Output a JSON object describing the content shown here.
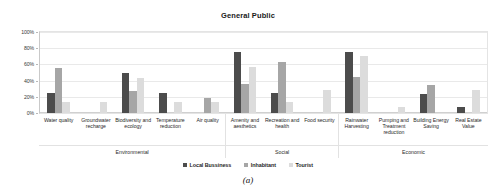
{
  "figure": {
    "caption": "(a)"
  },
  "chart_data": {
    "type": "bar",
    "title": "General Public",
    "xlabel": "",
    "ylabel": "",
    "ylim": [
      0,
      100
    ],
    "grid": true,
    "legend_position": "bottom",
    "ytick_labels": [
      "100%",
      "80%",
      "60%",
      "40%",
      "20%",
      "0%"
    ],
    "ytick_values": [
      100,
      80,
      60,
      40,
      20,
      0
    ],
    "categories": [
      "Water quality",
      "Groundwater recharge",
      "Biodiversity and ecology",
      "Temperature reduction",
      "Air quality",
      "Amenity and aesthetics",
      "Recreation and health",
      "Food security",
      "Rainwater Harvesting",
      "Pumping and Treatment reduction",
      "Building Energy Saving",
      "Real Estate Value"
    ],
    "groups": [
      {
        "name": "Environmental",
        "span": 5
      },
      {
        "name": "Social",
        "span": 3
      },
      {
        "name": "Economic",
        "span": 4
      }
    ],
    "series": [
      {
        "name": "Local Bussiness",
        "color": "#4c4c4c",
        "values": [
          25,
          0,
          50,
          25,
          0,
          75,
          25,
          0,
          75,
          0,
          24,
          8
        ]
      },
      {
        "name": "Inhabitant",
        "color": "#a6a6a6",
        "values": [
          55,
          0,
          27,
          0,
          18,
          36,
          63,
          0,
          45,
          0,
          35,
          0
        ]
      },
      {
        "name": "Tourist",
        "color": "#dcdcdc",
        "values": [
          14,
          14,
          43,
          13,
          13,
          57,
          13,
          29,
          70,
          8,
          0,
          28
        ]
      }
    ]
  }
}
